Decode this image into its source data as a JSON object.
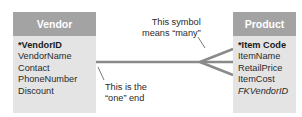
{
  "entities": {
    "vendor": {
      "title": "Vendor",
      "fields": [
        "*VendorID",
        "VendorName",
        "Contact",
        "PhoneNumber",
        "Discount"
      ],
      "primary_key": "*VendorID"
    },
    "product": {
      "title": "Product",
      "fields": [
        "*Item Code",
        "ItemName",
        "RetailPrice",
        "ItemCost",
        "FKVendorID"
      ],
      "primary_key": "*Item Code",
      "foreign_key": "FKVendorID"
    }
  },
  "relationship": {
    "type": "one-to-many",
    "from": "Vendor",
    "to": "Product"
  },
  "annotations": {
    "many_line1": "This symbol",
    "many_line2": "means “many”",
    "one_line1": "This is the",
    "one_line2": "“one” end"
  },
  "colors": {
    "header": "#a3a3a3",
    "body": "#e4e4e4",
    "connector": "#8a8a8a"
  }
}
